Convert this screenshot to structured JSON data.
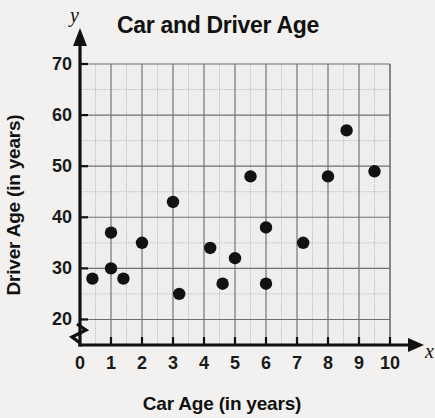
{
  "figure": {
    "title": "Car and Driver Age",
    "x_axis_letter": "x",
    "y_axis_letter": "y",
    "xlabel": "Car Age (in years)",
    "ylabel": "Driver Age (in years)",
    "background_color": "#f2f1ef",
    "point_color": "#121212",
    "grid_color": "#6f6f6f"
  },
  "chart_data": {
    "type": "scatter",
    "title": "Car and Driver Age",
    "xlabel": "Car Age (in years)",
    "ylabel": "Driver Age (in years)",
    "xlim": [
      0,
      10
    ],
    "ylim": [
      15,
      70
    ],
    "xticks": [
      0,
      1,
      2,
      3,
      4,
      5,
      6,
      7,
      8,
      9,
      10
    ],
    "xtick_labels": [
      "0",
      "1",
      "2",
      "3",
      "4",
      "5",
      "6",
      "7",
      "8",
      "9",
      "10"
    ],
    "yticks": [
      20,
      30,
      40,
      50,
      60,
      70
    ],
    "ytick_labels": [
      "20",
      "30",
      "40",
      "50",
      "60",
      "70"
    ],
    "y_minor_step": 5,
    "x_minor_step": 0.5,
    "grid": true,
    "y_axis_break": true,
    "legend": null,
    "points": [
      {
        "x": 0.4,
        "y": 28
      },
      {
        "x": 1.0,
        "y": 37
      },
      {
        "x": 1.0,
        "y": 30
      },
      {
        "x": 1.4,
        "y": 28
      },
      {
        "x": 2.0,
        "y": 35
      },
      {
        "x": 3.0,
        "y": 43
      },
      {
        "x": 3.2,
        "y": 25
      },
      {
        "x": 4.2,
        "y": 34
      },
      {
        "x": 4.6,
        "y": 27
      },
      {
        "x": 5.0,
        "y": 32
      },
      {
        "x": 5.5,
        "y": 48
      },
      {
        "x": 6.0,
        "y": 38
      },
      {
        "x": 6.0,
        "y": 27
      },
      {
        "x": 7.2,
        "y": 35
      },
      {
        "x": 8.0,
        "y": 48
      },
      {
        "x": 8.6,
        "y": 57
      },
      {
        "x": 9.5,
        "y": 49
      }
    ]
  }
}
